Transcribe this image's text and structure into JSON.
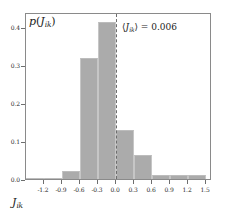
{
  "chart_data": {
    "type": "bar",
    "title": "",
    "subtitle": "",
    "xlabel": "J_ik",
    "ylabel": "p(J_ik)",
    "xlabel_parts": {
      "var": "J",
      "sub": "ik"
    },
    "ylabel_parts": {
      "func": "p",
      "open": "(",
      "var": "J",
      "sub": "ik",
      "close": ")"
    },
    "categories": [
      -1.35,
      -1.05,
      -0.75,
      -0.45,
      -0.15,
      0.15,
      0.45,
      0.75,
      1.05,
      1.35
    ],
    "values": [
      0.002,
      0.002,
      0.021,
      0.318,
      0.415,
      0.128,
      0.062,
      0.011,
      0.011,
      0.011
    ],
    "bin_width": 0.3,
    "xlim": [
      -1.5,
      1.6
    ],
    "ylim": [
      0.0,
      0.44
    ],
    "xticks": [
      -1.2,
      -0.9,
      -0.6,
      -0.3,
      0.0,
      0.3,
      0.6,
      0.9,
      1.2,
      1.5
    ],
    "xtick_labels": [
      "-1.2",
      "-0.9",
      "-0.6",
      "-0.3",
      "0.0",
      "0.3",
      "0.6",
      "0.9",
      "1.2",
      "1.5"
    ],
    "yticks": [
      0.0,
      0.1,
      0.2,
      0.3,
      0.4
    ],
    "ytick_labels": [
      "0.0",
      "0.1",
      "0.2",
      "0.3",
      "0.4"
    ],
    "grid": false,
    "legend": null,
    "bar_color": "#ababab",
    "zero_line": {
      "x": 0.0,
      "style": "dashed",
      "color": "#6d6d6d"
    },
    "annotations": [
      {
        "text": "⟨J_ik⟩ = 0.006",
        "parts": {
          "open": "⟨",
          "var": "J",
          "sub": "ik",
          "close": "⟩",
          "eq": "=",
          "value": "0.006"
        },
        "x": 0.18,
        "y": 0.4
      }
    ]
  },
  "figure": {
    "background": "#ffffff",
    "frame_color": "#8a8a8a"
  }
}
